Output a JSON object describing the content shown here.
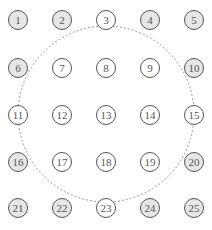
{
  "diagram": {
    "type": "grid-circle-overlay",
    "grid": {
      "rows": 5,
      "cols": 5
    },
    "colors": {
      "filled": "#e6e6e6",
      "empty": "#ffffff",
      "stroke": "#555555",
      "dashed_circle": "#888888"
    },
    "nodes": [
      {
        "label": "1",
        "filled": true
      },
      {
        "label": "2",
        "filled": true
      },
      {
        "label": "3",
        "filled": false
      },
      {
        "label": "4",
        "filled": true
      },
      {
        "label": "5",
        "filled": true
      },
      {
        "label": "6",
        "filled": true
      },
      {
        "label": "7",
        "filled": false
      },
      {
        "label": "8",
        "filled": false
      },
      {
        "label": "9",
        "filled": false
      },
      {
        "label": "10",
        "filled": true
      },
      {
        "label": "11",
        "filled": false
      },
      {
        "label": "12",
        "filled": false
      },
      {
        "label": "13",
        "filled": false
      },
      {
        "label": "14",
        "filled": false
      },
      {
        "label": "15",
        "filled": false
      },
      {
        "label": "16",
        "filled": true
      },
      {
        "label": "17",
        "filled": false
      },
      {
        "label": "18",
        "filled": false
      },
      {
        "label": "19",
        "filled": false
      },
      {
        "label": "20",
        "filled": true
      },
      {
        "label": "21",
        "filled": true
      },
      {
        "label": "22",
        "filled": true
      },
      {
        "label": "23",
        "filled": false
      },
      {
        "label": "24",
        "filled": true
      },
      {
        "label": "25",
        "filled": true
      }
    ],
    "dashed_circle": {
      "passes_through": [
        "3",
        "11",
        "15",
        "23"
      ]
    }
  }
}
